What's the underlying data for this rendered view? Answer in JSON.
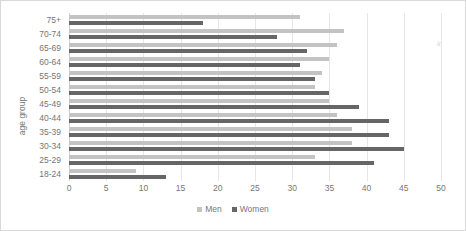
{
  "chart_data": {
    "type": "bar",
    "orientation": "horizontal",
    "title": "",
    "xlabel": "",
    "ylabel": "age group",
    "xlim": [
      0,
      50
    ],
    "xticks": [
      0,
      5,
      10,
      15,
      20,
      25,
      30,
      35,
      40,
      45,
      50
    ],
    "grid": true,
    "legend_position": "bottom-center",
    "categories": [
      "75+",
      "70-74",
      "65-69",
      "60-64",
      "55-59",
      "50-54",
      "45-49",
      "40-44",
      "35-39",
      "30-34",
      "25-29",
      "18-24"
    ],
    "series": [
      {
        "name": "Men",
        "color": "#c3c3c3",
        "values": [
          31,
          37,
          36,
          35,
          34,
          33,
          35,
          36,
          38,
          38,
          33,
          9
        ]
      },
      {
        "name": "Women",
        "color": "#666666",
        "values": [
          18,
          28,
          32,
          31,
          33,
          35,
          39,
          43,
          43,
          45,
          41,
          13
        ]
      }
    ]
  },
  "legend": {
    "items": [
      {
        "label": "Men",
        "key": "men"
      },
      {
        "label": "Women",
        "key": "women"
      }
    ]
  },
  "annotations": {
    "stray_mark": "x"
  }
}
